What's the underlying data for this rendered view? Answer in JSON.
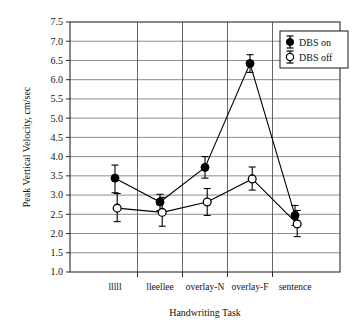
{
  "chart_data": {
    "type": "line",
    "title": "",
    "xlabel": "Handwriting Task",
    "ylabel": "Peak Vertical Velocity, cm/sec",
    "categories": [
      "lllll",
      "lleellee",
      "overlay-N",
      "overlay-F",
      "sentence"
    ],
    "ylim": [
      1.0,
      7.5
    ],
    "ytick_labels": [
      "7.5",
      "7.0",
      "6.5",
      "6.0",
      "5.5",
      "5.0",
      "4.5",
      "4.0",
      "3.5",
      "3.0",
      "2.5",
      "2.0",
      "1.5",
      "1.0"
    ],
    "ytick_values": [
      7.5,
      7.0,
      6.5,
      6.0,
      5.5,
      5.0,
      4.5,
      4.0,
      3.5,
      3.0,
      2.5,
      2.0,
      1.5,
      1.0
    ],
    "grid": "horizontal-and-vertical",
    "legend_position": "top-right",
    "series": [
      {
        "name": "DBS on",
        "marker": "filled-circle",
        "color": "#000000",
        "values": [
          3.44,
          2.82,
          3.72,
          6.42,
          2.47
        ],
        "err_low": [
          3.06,
          2.6,
          3.44,
          6.19,
          2.21
        ],
        "err_high": [
          3.78,
          3.02,
          4.0,
          6.65,
          2.73
        ]
      },
      {
        "name": "DBS off",
        "marker": "open-circle",
        "color": "#000000",
        "values": [
          2.66,
          2.55,
          2.82,
          3.42,
          2.25
        ],
        "err_low": [
          2.31,
          2.19,
          2.47,
          3.13,
          1.92
        ],
        "err_high": [
          3.04,
          2.94,
          3.17,
          3.73,
          2.6
        ]
      }
    ]
  },
  "legend": {
    "entries": [
      {
        "label": "DBS on",
        "marker": "filled-circle"
      },
      {
        "label": "DBS off",
        "marker": "open-circle"
      }
    ]
  },
  "colors": {
    "axis": "#2b2b2b",
    "grid": "#808080",
    "series": "#000000",
    "background": "#ffffff"
  }
}
